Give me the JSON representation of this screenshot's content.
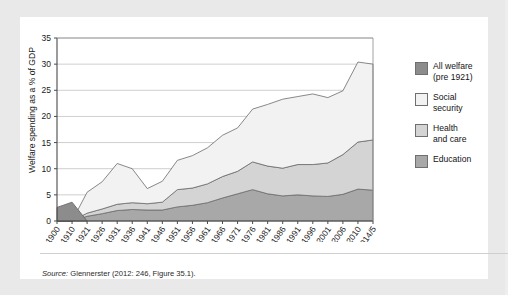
{
  "figure": {
    "source_prefix": "Source:",
    "source_text": "Glennerster (2012: 246, Figure 35.1)."
  },
  "legend": {
    "items": [
      {
        "label": "All welfare\n(pre 1921)",
        "color": "#8c8c8c",
        "name": "all-welfare-pre-1921"
      },
      {
        "label": "Social\nsecurity",
        "color": "#f2f2f2",
        "name": "social-security"
      },
      {
        "label": "Health\nand care",
        "color": "#d4d4d4",
        "name": "health-and-care"
      },
      {
        "label": "Education",
        "color": "#a8a8a8",
        "name": "education"
      }
    ]
  },
  "chart_data": {
    "type": "area",
    "stacked": true,
    "title": "",
    "xlabel": "",
    "ylabel": "Welfare spending as a % of GDP",
    "ylim": [
      0,
      35
    ],
    "yticks": [
      0,
      5,
      10,
      15,
      20,
      25,
      30,
      35
    ],
    "grid": true,
    "legend_position": "right",
    "categories": [
      "1900",
      "1910",
      "1921",
      "1926",
      "1931",
      "1936",
      "1941",
      "1946",
      "1951",
      "1956",
      "1961",
      "1966",
      "1971",
      "1976",
      "1981",
      "1986",
      "1991",
      "1996",
      "2001",
      "2006",
      "2010",
      "2014/5"
    ],
    "series": [
      {
        "name": "Education",
        "color": "#a8a8a8",
        "values": [
          0,
          0,
          0.9,
          1.4,
          2.0,
          2.2,
          2.1,
          2.1,
          2.7,
          3.0,
          3.5,
          4.4,
          5.2,
          6.0,
          5.2,
          4.8,
          5.0,
          4.8,
          4.7,
          5.1,
          6.1,
          5.9
        ]
      },
      {
        "name": "Health and care",
        "color": "#d4d4d4",
        "values": [
          0,
          0,
          0.6,
          0.9,
          1.2,
          1.3,
          1.2,
          1.5,
          3.3,
          3.3,
          3.6,
          4.1,
          4.3,
          5.3,
          5.3,
          5.3,
          5.8,
          6.0,
          6.4,
          7.6,
          9.0,
          9.6
        ]
      },
      {
        "name": "Social security",
        "color": "#f2f2f2",
        "values": [
          0,
          0,
          4.0,
          5.2,
          7.8,
          6.5,
          2.9,
          4.0,
          5.6,
          6.2,
          6.9,
          7.9,
          8.3,
          10.1,
          11.8,
          13.2,
          13.0,
          13.5,
          12.5,
          12.2,
          15.3,
          14.5
        ]
      },
      {
        "name": "All welfare (pre 1921)",
        "color": "#8c8c8c",
        "values": [
          2.6,
          3.6,
          0,
          0,
          0,
          0,
          0,
          0,
          0,
          0,
          0,
          0,
          0,
          0,
          0,
          0,
          0,
          0,
          0,
          0,
          0,
          0
        ]
      }
    ],
    "totals": [
      2.6,
      3.6,
      5.5,
      7.5,
      11.0,
      10.0,
      6.2,
      7.6,
      11.6,
      12.5,
      14.0,
      16.4,
      17.8,
      21.4,
      22.3,
      23.3,
      23.8,
      24.3,
      23.6,
      24.9,
      30.4,
      30.0
    ]
  }
}
